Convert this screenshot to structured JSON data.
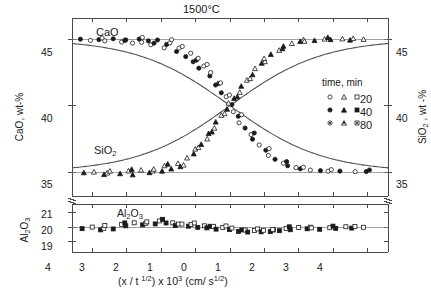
{
  "chart_data": {
    "type": "scatter",
    "title": "1500°C",
    "xlabel_parts": {
      "pre": "(x / t",
      "sup1": "1/2",
      "mid": ") x 10",
      "sup2": "3",
      "post": " (cm/ s",
      "sup3": "1/2",
      "close": ")"
    },
    "xlabel_plain": "(x / t 1/2) x 10^3 (cm/ s^1/2)",
    "x_tick_labels": [
      "4",
      "3",
      "2",
      "1",
      "0",
      "1",
      "2",
      "3",
      "4"
    ],
    "x_tick_values": [
      -4,
      -3,
      -2,
      -1,
      0,
      1,
      2,
      3,
      4
    ],
    "xlim": [
      -4.6,
      4.6
    ],
    "grid": false,
    "panels": [
      {
        "name": "upper",
        "left_axis_label": "CaO, wt-%",
        "right_axis_label": "SiO2 , wt -%",
        "ylim": [
          33.2,
          46.6
        ],
        "y_tick_labels_left": [
          "45",
          "40",
          "35"
        ],
        "y_tick_labels_right": [
          "45",
          "40",
          "35"
        ],
        "y_tick_values": [
          45,
          40,
          35
        ],
        "curve_labels": [
          {
            "text": "CaO",
            "x": -2.75,
            "y": 46.0
          },
          {
            "text": "SiO2",
            "x": -2.75,
            "y": 35.9
          }
        ],
        "series": [
          {
            "name": "CaO",
            "symbol": "circle",
            "trend": "sigmoid-down",
            "plateau_high": 45.0,
            "plateau_low": 35.0,
            "center": 0.0,
            "width": 1.35
          },
          {
            "name": "SiO2",
            "symbol": "triangle",
            "trend": "sigmoid-up",
            "plateau_low": 35.0,
            "plateau_high": 45.0,
            "center": 0.0,
            "width": 1.35
          }
        ]
      },
      {
        "name": "lower",
        "left_axis_label": "Al2O3",
        "ylim": [
          18.3,
          21.6
        ],
        "y_tick_labels_left": [
          "21",
          "20",
          "19"
        ],
        "y_tick_values": [
          21,
          20,
          19
        ],
        "curve_labels": [
          {
            "text": "Al2O3",
            "x": -1.9,
            "y": 20.95
          }
        ],
        "series": [
          {
            "name": "Al2O3",
            "symbol": "square",
            "trend": "flat",
            "level": 20.0,
            "scatter": 0.38
          }
        ]
      }
    ],
    "legend": {
      "title": "time, min",
      "position": "inside-right-upper-panel",
      "rows": [
        {
          "label": "20",
          "symbols": [
            "open-circle",
            "open-triangle",
            "open-square"
          ]
        },
        {
          "label": "40",
          "symbols": [
            "filled-circle",
            "filled-triangle",
            "filled-square"
          ]
        },
        {
          "label": "80",
          "symbols": [
            "half-circle",
            "half-triangle",
            "half-square"
          ]
        }
      ]
    },
    "colors": {
      "axis": "#4a4a4a",
      "marker": "#1a1a1a",
      "curve": "#555555",
      "background": "#ffffff"
    },
    "points": {
      "CaO": [
        [
          -4.3,
          45.05
        ],
        [
          -4.05,
          44.95
        ],
        [
          -3.85,
          45.0
        ],
        [
          -3.6,
          44.9
        ],
        [
          -3.4,
          45.05
        ],
        [
          -3.2,
          44.8
        ],
        [
          -3.0,
          44.95
        ],
        [
          -2.85,
          44.7
        ],
        [
          -2.7,
          45.0
        ],
        [
          -2.55,
          44.75
        ],
        [
          -2.4,
          44.85
        ],
        [
          -2.25,
          44.55
        ],
        [
          -2.1,
          44.9
        ],
        [
          -1.95,
          44.4
        ],
        [
          -1.8,
          44.65
        ],
        [
          -1.7,
          45.0
        ],
        [
          -1.6,
          44.1
        ],
        [
          -1.45,
          44.35
        ],
        [
          -1.3,
          43.7
        ],
        [
          -1.2,
          43.95
        ],
        [
          -1.05,
          43.3
        ],
        [
          -0.95,
          43.55
        ],
        [
          -0.85,
          42.8
        ],
        [
          -0.75,
          42.95
        ],
        [
          -0.62,
          42.2
        ],
        [
          -0.52,
          42.45
        ],
        [
          -0.42,
          41.6
        ],
        [
          -0.32,
          41.75
        ],
        [
          -0.22,
          41.0
        ],
        [
          -0.12,
          40.7
        ],
        [
          0.0,
          40.1
        ],
        [
          0.12,
          39.55
        ],
        [
          0.22,
          39.2
        ],
        [
          0.32,
          38.7
        ],
        [
          0.45,
          38.3
        ],
        [
          0.58,
          37.8
        ],
        [
          0.7,
          37.45
        ],
        [
          0.85,
          37.0
        ],
        [
          1.0,
          36.6
        ],
        [
          1.15,
          36.3
        ],
        [
          1.3,
          36.0
        ],
        [
          1.5,
          35.7
        ],
        [
          1.7,
          35.5
        ],
        [
          1.9,
          35.35
        ],
        [
          2.1,
          35.25
        ],
        [
          2.35,
          35.15
        ],
        [
          2.6,
          35.1
        ],
        [
          2.9,
          35.05
        ],
        [
          3.2,
          35.05
        ],
        [
          3.6,
          35.0
        ],
        [
          4.0,
          35.0
        ]
      ],
      "SiO2": [
        [
          -4.2,
          35.0
        ],
        [
          -3.95,
          35.05
        ],
        [
          -3.7,
          34.85
        ],
        [
          -3.45,
          35.1
        ],
        [
          -3.2,
          34.9
        ],
        [
          -3.0,
          35.1
        ],
        [
          -2.8,
          34.8
        ],
        [
          -2.6,
          35.15
        ],
        [
          -2.4,
          34.95
        ],
        [
          -2.2,
          35.2
        ],
        [
          -2.0,
          35.05
        ],
        [
          -1.85,
          35.45
        ],
        [
          -1.7,
          35.2
        ],
        [
          -1.55,
          35.7
        ],
        [
          -1.4,
          35.45
        ],
        [
          -1.25,
          36.1
        ],
        [
          -1.1,
          36.4
        ],
        [
          -0.98,
          36.75
        ],
        [
          -0.85,
          37.1
        ],
        [
          -0.72,
          37.5
        ],
        [
          -0.6,
          37.9
        ],
        [
          -0.48,
          38.3
        ],
        [
          -0.36,
          38.75
        ],
        [
          -0.24,
          39.25
        ],
        [
          -0.12,
          39.7
        ],
        [
          0.0,
          40.15
        ],
        [
          0.12,
          40.6
        ],
        [
          0.24,
          41.05
        ],
        [
          0.36,
          41.5
        ],
        [
          0.48,
          41.95
        ],
        [
          0.6,
          42.35
        ],
        [
          0.75,
          42.8
        ],
        [
          0.9,
          43.2
        ],
        [
          1.05,
          43.55
        ],
        [
          1.2,
          43.85
        ],
        [
          1.4,
          44.15
        ],
        [
          1.6,
          44.45
        ],
        [
          1.8,
          44.65
        ],
        [
          2.0,
          44.8
        ],
        [
          2.2,
          44.9
        ],
        [
          2.45,
          44.95
        ],
        [
          2.7,
          45.05
        ],
        [
          2.95,
          45.0
        ],
        [
          3.25,
          45.05
        ],
        [
          3.55,
          44.95
        ],
        [
          3.9,
          45.0
        ]
      ],
      "Al2O3": [
        [
          -4.25,
          19.95
        ],
        [
          -4.0,
          20.05
        ],
        [
          -3.8,
          19.85
        ],
        [
          -3.6,
          20.15
        ],
        [
          -3.4,
          19.9
        ],
        [
          -3.2,
          20.2
        ],
        [
          -3.0,
          20.1
        ],
        [
          -2.8,
          20.3
        ],
        [
          -2.6,
          20.15
        ],
        [
          -2.4,
          20.35
        ],
        [
          -2.2,
          20.2
        ],
        [
          -2.0,
          20.4
        ],
        [
          -1.85,
          20.25
        ],
        [
          -1.7,
          20.35
        ],
        [
          -1.55,
          20.15
        ],
        [
          -1.4,
          20.25
        ],
        [
          -1.25,
          20.1
        ],
        [
          -1.1,
          20.2
        ],
        [
          -0.95,
          20.0
        ],
        [
          -0.8,
          20.1
        ],
        [
          -0.65,
          19.95
        ],
        [
          -0.5,
          20.05
        ],
        [
          -0.35,
          19.85
        ],
        [
          -0.2,
          19.95
        ],
        [
          -0.05,
          19.8
        ],
        [
          0.1,
          19.9
        ],
        [
          0.25,
          19.75
        ],
        [
          0.4,
          19.85
        ],
        [
          0.55,
          19.7
        ],
        [
          0.7,
          19.8
        ],
        [
          0.85,
          19.7
        ],
        [
          1.0,
          19.8
        ],
        [
          1.15,
          19.7
        ],
        [
          1.3,
          19.85
        ],
        [
          1.45,
          19.75
        ],
        [
          1.6,
          19.9
        ],
        [
          1.8,
          19.8
        ],
        [
          2.0,
          19.95
        ],
        [
          2.2,
          19.85
        ],
        [
          2.4,
          20.0
        ],
        [
          2.6,
          19.9
        ],
        [
          2.85,
          20.0
        ],
        [
          3.1,
          19.95
        ],
        [
          3.35,
          20.05
        ],
        [
          3.6,
          19.95
        ],
        [
          3.9,
          20.0
        ]
      ]
    }
  }
}
